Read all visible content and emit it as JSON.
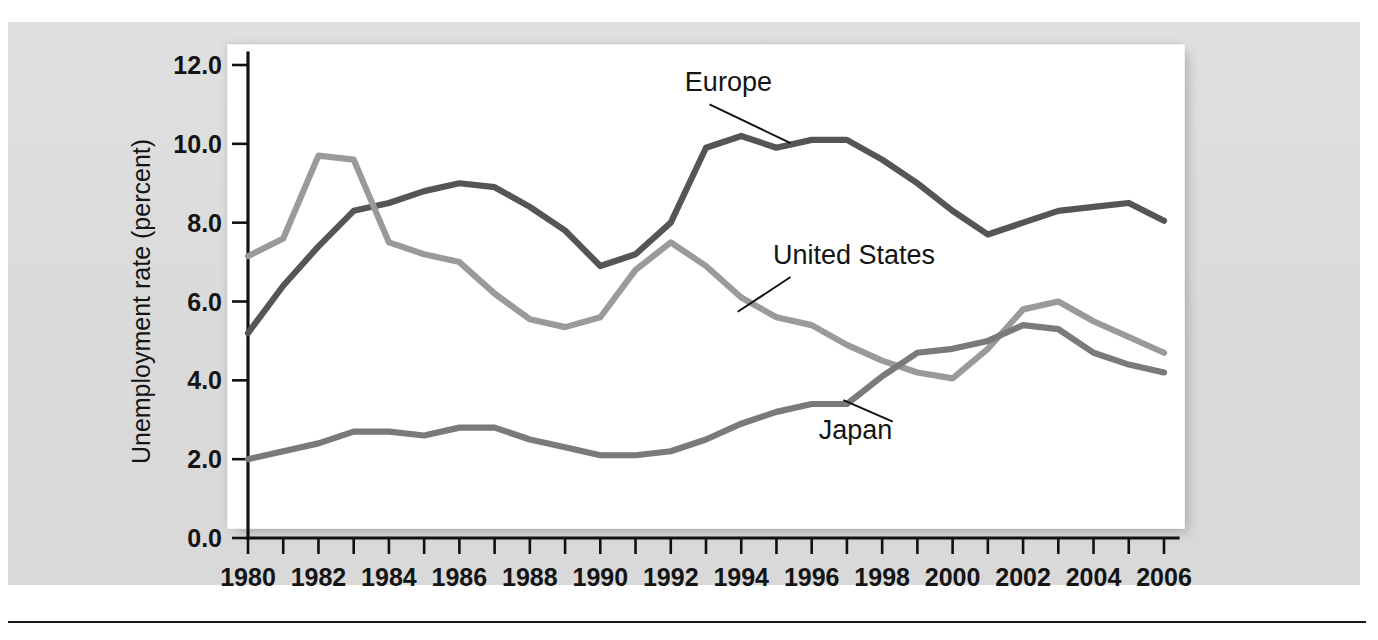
{
  "figure": {
    "background_color": "#dddddd",
    "plot_background_color": "#ffffff",
    "axis_color": "#111111"
  },
  "chart_data": {
    "type": "line",
    "title": "",
    "subtitle": "",
    "xlabel": "",
    "ylabel": "Unemployment rate (percent)",
    "xlim": [
      1980,
      2006
    ],
    "ylim": [
      0.0,
      12.0
    ],
    "grid": false,
    "legend_position": "inline-labels",
    "y_ticks": [
      0.0,
      2.0,
      4.0,
      6.0,
      8.0,
      10.0,
      12.0
    ],
    "y_tick_labels": [
      "0.0",
      "2.0",
      "4.0",
      "6.0",
      "8.0",
      "10.0",
      "12.0"
    ],
    "x_ticks": [
      1980,
      1981,
      1982,
      1983,
      1984,
      1985,
      1986,
      1987,
      1988,
      1989,
      1990,
      1991,
      1992,
      1993,
      1994,
      1995,
      1996,
      1997,
      1998,
      1999,
      2000,
      2001,
      2002,
      2003,
      2004,
      2005,
      2006
    ],
    "x_tick_labels_shown": [
      "1980",
      "1982",
      "1984",
      "1986",
      "1988",
      "1990",
      "1992",
      "1994",
      "1996",
      "1998",
      "2000",
      "2002",
      "2004",
      "2006"
    ],
    "x": [
      1980,
      1981,
      1982,
      1983,
      1984,
      1985,
      1986,
      1987,
      1988,
      1989,
      1990,
      1991,
      1992,
      1993,
      1994,
      1995,
      1996,
      1997,
      1998,
      1999,
      2000,
      2001,
      2002,
      2003,
      2004,
      2005,
      2006
    ],
    "series": [
      {
        "name": "Europe",
        "color": "#555555",
        "label": "Europe",
        "values": [
          5.2,
          6.4,
          7.4,
          8.3,
          8.5,
          8.8,
          9.0,
          8.9,
          8.4,
          7.8,
          6.9,
          7.2,
          8.0,
          9.9,
          10.2,
          9.9,
          10.1,
          10.1,
          9.6,
          9.0,
          8.3,
          7.7,
          8.0,
          8.3,
          8.4,
          8.5,
          8.05
        ]
      },
      {
        "name": "United States",
        "color": "#9a9a9a",
        "label": "United States",
        "values": [
          7.15,
          7.6,
          9.7,
          9.6,
          7.5,
          7.2,
          7.0,
          6.2,
          5.55,
          5.35,
          5.6,
          6.8,
          7.5,
          6.9,
          6.1,
          5.6,
          5.4,
          4.9,
          4.5,
          4.2,
          4.05,
          4.8,
          5.8,
          6.0,
          5.5,
          5.1,
          4.7
        ]
      },
      {
        "name": "Japan",
        "color": "#7a7a7a",
        "label": "Japan",
        "values": [
          2.0,
          2.2,
          2.4,
          2.7,
          2.7,
          2.6,
          2.8,
          2.8,
          2.5,
          2.3,
          2.1,
          2.1,
          2.2,
          2.5,
          2.9,
          3.2,
          3.4,
          3.4,
          4.1,
          4.7,
          4.8,
          5.0,
          5.4,
          5.3,
          4.7,
          4.4,
          4.2
        ]
      }
    ],
    "annotations": [
      {
        "name": "europe-label",
        "text": "Europe",
        "text_x": 1992.4,
        "text_y": 11.35,
        "leader_from_x": 1993.1,
        "leader_from_y": 11.0,
        "leader_to_x": 1995.4,
        "leader_to_y": 10.02
      },
      {
        "name": "united-states-label",
        "text": "United States",
        "text_x": 1994.9,
        "text_y": 6.95,
        "leader_from_x": 1995.4,
        "leader_from_y": 6.62,
        "leader_to_x": 1993.9,
        "leader_to_y": 5.74
      },
      {
        "name": "japan-label",
        "text": "Japan",
        "text_x": 1996.2,
        "text_y": 2.52,
        "leader_from_x": 1998.3,
        "leader_from_y": 2.95,
        "leader_to_x": 1996.9,
        "leader_to_y": 3.5
      }
    ]
  }
}
